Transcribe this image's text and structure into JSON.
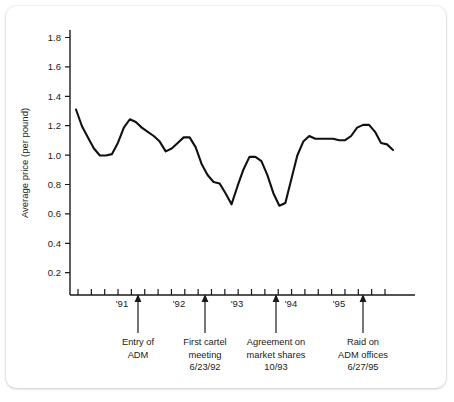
{
  "figure": {
    "background_color": "#ffffff",
    "line_color": "#111111",
    "text_color": "#1a1a1a"
  },
  "chart_data": {
    "type": "line",
    "title": "",
    "xlabel": "",
    "ylabel": "Average price (per pound)",
    "ylim": [
      0,
      1.9
    ],
    "yticks": [
      0.2,
      0.4,
      0.6,
      0.8,
      1.0,
      1.2,
      1.4,
      1.6,
      1.8
    ],
    "ytick_labels": [
      "0.2",
      "0.4",
      "0.6",
      "0.8",
      "1.0",
      "1.2",
      "1.4",
      "1.6",
      "1.8"
    ],
    "xtick_labels": [
      "'91",
      "'92",
      "'93",
      "'94",
      "'95"
    ],
    "xtick_positions": [
      4,
      12,
      20,
      28,
      36
    ],
    "xlim": [
      0,
      46
    ],
    "minor_tick_count": 46,
    "grid": false,
    "legend": null,
    "series": [
      {
        "name": "Average lysine price (per pound)",
        "x": [
          0,
          1,
          2,
          3,
          4,
          5,
          6,
          7,
          8,
          9,
          10,
          11,
          12,
          13,
          14,
          15,
          16,
          17,
          18,
          19,
          20,
          21,
          22,
          23,
          24,
          25,
          26,
          27,
          28,
          29,
          30,
          31,
          32,
          33,
          34,
          35,
          36,
          37,
          38,
          39,
          40,
          41,
          42,
          43,
          44,
          45
        ],
        "values": [
          1.33,
          1.21,
          1.13,
          1.05,
          1.0,
          1.0,
          1.01,
          1.09,
          1.2,
          1.26,
          1.24,
          1.2,
          1.17,
          1.14,
          1.1,
          1.03,
          1.05,
          1.09,
          1.13,
          1.13,
          1.06,
          0.94,
          0.86,
          0.81,
          0.8,
          0.73,
          0.65,
          0.78,
          0.9,
          0.99,
          0.99,
          0.96,
          0.86,
          0.73,
          0.64,
          0.66,
          0.83,
          1.0,
          1.1,
          1.14,
          1.12,
          1.12,
          1.12,
          1.12,
          1.11,
          1.11
        ]
      }
    ],
    "series_continued": {
      "note": "values continue to right edge",
      "x": [
        46,
        47,
        48,
        49,
        50,
        51,
        52,
        53
      ],
      "values": [
        1.14,
        1.2,
        1.22,
        1.22,
        1.17,
        1.09,
        1.08,
        1.04
      ]
    },
    "annotations": [
      {
        "id": "entry-of-adm",
        "lines": [
          "Entry of",
          "ADM"
        ],
        "x_position": 138
      },
      {
        "id": "first-cartel-meeting",
        "lines": [
          "First cartel",
          "meeting",
          "6/23/92"
        ],
        "x_position": 205
      },
      {
        "id": "agreement-on-market-shares",
        "lines": [
          "Agreement on",
          "market shares",
          "10/93"
        ],
        "x_position": 276
      },
      {
        "id": "raid-on-adm-offices",
        "lines": [
          "Raid on",
          "ADM offices",
          "6/27/95"
        ],
        "x_position": 363
      }
    ]
  }
}
